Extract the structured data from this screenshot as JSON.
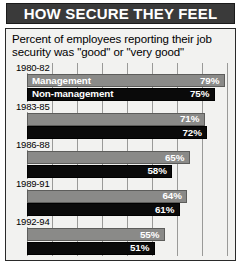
{
  "header": {
    "title": "HOW SECURE THEY FEEL"
  },
  "card": {
    "subtitle": "Percent of employees reporting their job security was \"good\" or \"very good\""
  },
  "colors": {
    "title_bar_bg": "#3a3a3a",
    "title_text": "#ffffff",
    "card_bg": "#f2f2f0",
    "management_bar": "#8a8a88",
    "non_management_bar": "#0a0a0a",
    "gridline": "#9a9a98",
    "value_label": "#ffffff"
  },
  "chart_data": {
    "type": "bar",
    "orientation": "horizontal",
    "title": "HOW SECURE THEY FEEL",
    "subtitle": "Percent of employees reporting their job security was \"good\" or \"very good\"",
    "xlabel": "",
    "ylabel": "",
    "xlim": [
      0,
      100
    ],
    "grid": true,
    "grid_axis": "x",
    "legend_position": "in-bar-first-group",
    "categories": [
      "1980-82",
      "1983-85",
      "1986-88",
      "1989-91",
      "1992-94"
    ],
    "series": [
      {
        "name": "Management",
        "color": "#8a8a88",
        "values": [
          79,
          71,
          65,
          64,
          55
        ],
        "value_labels": [
          "79%",
          "71%",
          "65%",
          "64%",
          "55%"
        ]
      },
      {
        "name": "Non-management",
        "color": "#0a0a0a",
        "values": [
          75,
          72,
          58,
          61,
          51
        ],
        "value_labels": [
          "75%",
          "72%",
          "58%",
          "61%",
          "51%"
        ]
      }
    ]
  }
}
